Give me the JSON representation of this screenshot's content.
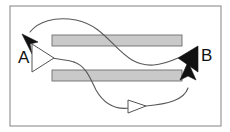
{
  "figure": {
    "title": "",
    "background_color": "#ffffff",
    "frame": {
      "name": "diagram-frame",
      "x": 10,
      "y": 6,
      "width": 211,
      "height": 120,
      "stroke_color": "#8e8e8e",
      "fill_color": "#ffffff"
    },
    "obstacles": [
      {
        "name": "upper-bar",
        "x": 52,
        "y": 35,
        "width": 130,
        "height": 11,
        "fill_color": "#c9c9c9",
        "stroke_color": "#6e6e6e"
      },
      {
        "name": "lower-bar",
        "x": 52,
        "y": 70,
        "width": 130,
        "height": 11,
        "fill_color": "#c9c9c9",
        "stroke_color": "#6e6e6e"
      }
    ],
    "labels": [
      {
        "name": "label-a",
        "text": "A",
        "x": 18,
        "y": 63,
        "color": "#111111"
      },
      {
        "name": "label-b",
        "text": "B",
        "x": 201,
        "y": 61,
        "color": "#111111"
      }
    ],
    "paths": [
      {
        "name": "upper-route",
        "description": "curve from B side over the upper bar to arrowhead at A",
        "d": "M 178 58 C 160 66 146 68 132 60 C 112 48 104 26 76 20 C 54 16 38 22 30 32",
        "stroke_color": "#585858"
      },
      {
        "name": "middle-route",
        "description": "short curve from hollow triangle at A toward the lower crossing",
        "d": "M 52 58 C 62 60 68 60 74 62",
        "stroke_color": "#585858"
      },
      {
        "name": "lower-route",
        "description": "curve descending past the lower bar then right and up to B approach arrow",
        "d": "M 74 62 C 86 66 90 78 96 90 C 104 104 116 110 130 108",
        "stroke_color": "#585858"
      },
      {
        "name": "lower-return",
        "description": "curve continuing right then turning upward to the vertical arrow below B",
        "d": "M 146 106 C 168 104 184 100 188 88",
        "stroke_color": "#585858"
      }
    ],
    "arrowheads": [
      {
        "name": "arrowhead-to-a",
        "style": "filled",
        "direction": "up-left",
        "points": "22,34 38,42 30,44 32,54",
        "fill_color": "#111111"
      },
      {
        "name": "arrowhead-from-a",
        "style": "hollow",
        "direction": "right",
        "points": "32,44 54,58 32,72",
        "fill_color": "#ffffff",
        "stroke_color": "#555555"
      },
      {
        "name": "arrowhead-to-b",
        "style": "filled",
        "direction": "left",
        "points": "178,58 198,46 198,72",
        "fill_color": "#111111"
      },
      {
        "name": "arrowhead-midpath",
        "style": "hollow",
        "direction": "right",
        "points": "128,100 146,106 128,113",
        "fill_color": "#ffffff",
        "stroke_color": "#555555"
      },
      {
        "name": "arrowhead-up-to-b",
        "style": "filled",
        "direction": "up",
        "points": "188,62 196,80 188,76 180,80",
        "fill_color": "#111111"
      }
    ]
  }
}
